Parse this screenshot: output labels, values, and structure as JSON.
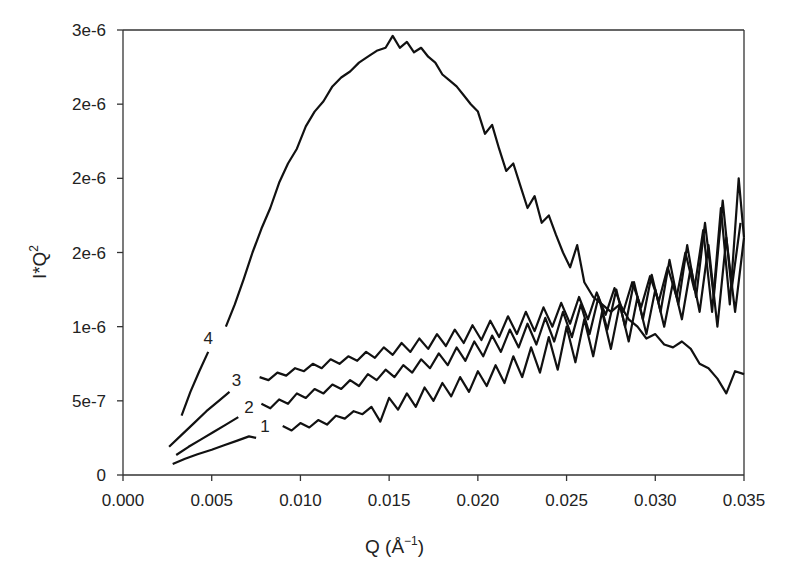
{
  "chart_data": {
    "type": "line",
    "title": "",
    "xlabel": "Q (Å",
    "xlabel_sup": "−1",
    "xlabel_close": ")",
    "ylabel": "I*Q",
    "ylabel_sup": "2",
    "xlim": [
      0.0,
      0.035
    ],
    "ylim": [
      0,
      3e-06
    ],
    "grid": false,
    "legend": "none (inline curve labels)",
    "x_ticks": [
      0.0,
      0.005,
      0.01,
      0.015,
      0.02,
      0.025,
      0.03,
      0.035
    ],
    "x_tick_labels": [
      "0.000",
      "0.005",
      "0.010",
      "0.015",
      "0.020",
      "0.025",
      "0.030",
      "0.035"
    ],
    "y_ticks": [
      0,
      5e-07,
      1e-06,
      1.5e-06,
      2e-06,
      2.5e-06,
      3e-06
    ],
    "y_tick_labels": [
      "0",
      "5e-7",
      "1e-6",
      "2e-6",
      "2e-6",
      "2e-6",
      "3e-6"
    ],
    "series": [
      {
        "name": "1",
        "label": "1",
        "label_at": [
          0.008,
          2.9e-07
        ],
        "segments": [
          {
            "x": [
              0.0028,
              0.0035,
              0.0042,
              0.005,
              0.0057,
              0.0064,
              0.0071,
              0.0075
            ],
            "y": [
              7.5e-08,
              1.1e-07,
              1.4e-07,
              1.7e-07,
              2e-07,
              2.3e-07,
              2.6e-07,
              2.5e-07
            ]
          },
          {
            "x": [
              0.009,
              0.0095,
              0.01,
              0.0105,
              0.011,
              0.0115,
              0.012,
              0.0125,
              0.013,
              0.0135,
              0.014,
              0.0145,
              0.015,
              0.0155,
              0.016,
              0.0165,
              0.017,
              0.0175,
              0.018,
              0.0185,
              0.019,
              0.0195,
              0.02,
              0.0205,
              0.021,
              0.0215,
              0.022,
              0.0225,
              0.023,
              0.0235,
              0.024,
              0.0245,
              0.025,
              0.0255,
              0.026,
              0.0265,
              0.027,
              0.0275,
              0.028,
              0.0285,
              0.029,
              0.0295,
              0.03,
              0.0305,
              0.031,
              0.0315,
              0.032,
              0.0325,
              0.033,
              0.0335,
              0.034,
              0.0345,
              0.035
            ],
            "y": [
              3.3e-07,
              3e-07,
              3.5e-07,
              3.2e-07,
              3.7e-07,
              3.4e-07,
              4e-07,
              3.8e-07,
              4.3e-07,
              4.1e-07,
              4.6e-07,
              3.6e-07,
              5.2e-07,
              4.4e-07,
              5.5e-07,
              4.6e-07,
              5.9e-07,
              5e-07,
              6.2e-07,
              5.3e-07,
              6.6e-07,
              5.6e-07,
              7e-07,
              6e-07,
              7.4e-07,
              6.2e-07,
              8e-07,
              6.6e-07,
              8.6e-07,
              6.9e-07,
              9.3e-07,
              7.1e-07,
              1e-06,
              7.6e-07,
              1.05e-06,
              8e-07,
              1.1e-06,
              8.5e-07,
              1.15e-06,
              9e-07,
              1.2e-06,
              9.5e-07,
              1.25e-06,
              1e-06,
              1.3e-06,
              1.05e-06,
              1.4e-06,
              1.1e-06,
              1.55e-06,
              1e-06,
              1.6e-06,
              1.1e-06,
              1.6e-06
            ]
          }
        ]
      },
      {
        "name": "2",
        "label": "2",
        "label_at": [
          0.0071,
          4.2e-07
        ],
        "segments": [
          {
            "x": [
              0.003,
              0.0037,
              0.0044,
              0.0051,
              0.0058,
              0.0065
            ],
            "y": [
              1.35e-07,
              1.9e-07,
              2.4e-07,
              2.9e-07,
              3.4e-07,
              3.9e-07
            ]
          },
          {
            "x": [
              0.0078,
              0.0083,
              0.0088,
              0.0093,
              0.0098,
              0.0103,
              0.0108,
              0.0113,
              0.0118,
              0.0123,
              0.0128,
              0.0133,
              0.0138,
              0.0143,
              0.0148,
              0.0153,
              0.0158,
              0.0163,
              0.0168,
              0.0173,
              0.0178,
              0.0183,
              0.0188,
              0.0193,
              0.0198,
              0.0203,
              0.0208,
              0.0213,
              0.0218,
              0.0223,
              0.0228,
              0.0233,
              0.0238,
              0.0243,
              0.0248,
              0.0253,
              0.0258,
              0.0263,
              0.0268,
              0.0273,
              0.0278,
              0.0283,
              0.0288,
              0.0293,
              0.0298,
              0.0303,
              0.0308,
              0.0313,
              0.0318,
              0.0323,
              0.0328,
              0.0333,
              0.0338,
              0.0343,
              0.0348
            ],
            "y": [
              4.8e-07,
              4.5e-07,
              5.1e-07,
              4.8e-07,
              5.5e-07,
              5.2e-07,
              5.8e-07,
              5.5e-07,
              6.1e-07,
              5.8e-07,
              6.4e-07,
              6e-07,
              6.8e-07,
              6.4e-07,
              7.1e-07,
              6.6e-07,
              7.4e-07,
              6.9e-07,
              7.8e-07,
              7.2e-07,
              8.2e-07,
              7.4e-07,
              8.6e-07,
              7.7e-07,
              9e-07,
              8e-07,
              9.4e-07,
              8.3e-07,
              9.8e-07,
              8.6e-07,
              1.02e-06,
              8.8e-07,
              1.06e-06,
              9e-07,
              1.1e-06,
              9.3e-07,
              1.15e-06,
              9.5e-07,
              1.2e-06,
              9.8e-07,
              1.25e-06,
              1e-06,
              1.3e-06,
              1.05e-06,
              1.35e-06,
              1.1e-06,
              1.45e-06,
              1.15e-06,
              1.55e-06,
              1.2e-06,
              1.7e-06,
              1.2e-06,
              1.85e-06,
              1.25e-06,
              1.7e-06
            ]
          }
        ]
      },
      {
        "name": "3",
        "label": "3",
        "label_at": [
          0.0064,
          6e-07
        ],
        "segments": [
          {
            "x": [
              0.0026,
              0.0033,
              0.004,
              0.0047,
              0.0054,
              0.006
            ],
            "y": [
              1.9e-07,
              2.7e-07,
              3.5e-07,
              4.3e-07,
              5e-07,
              5.6e-07
            ]
          },
          {
            "x": [
              0.0077,
              0.0082,
              0.0087,
              0.0092,
              0.0097,
              0.0102,
              0.0107,
              0.0112,
              0.0117,
              0.0122,
              0.0127,
              0.0132,
              0.0137,
              0.0142,
              0.0147,
              0.0152,
              0.0157,
              0.0162,
              0.0167,
              0.0172,
              0.0177,
              0.0182,
              0.0187,
              0.0192,
              0.0197,
              0.0202,
              0.0207,
              0.0212,
              0.0217,
              0.0222,
              0.0227,
              0.0232,
              0.0237,
              0.0242,
              0.0247,
              0.0252,
              0.0257,
              0.0262,
              0.0267,
              0.0272,
              0.0277,
              0.0282,
              0.0287,
              0.0292,
              0.0297,
              0.0302,
              0.0307,
              0.0312,
              0.0317,
              0.0322,
              0.0327,
              0.0332,
              0.0337,
              0.0342,
              0.0347,
              0.035
            ],
            "y": [
              6.6e-07,
              6.4e-07,
              6.9e-07,
              6.7e-07,
              7.2e-07,
              7e-07,
              7.5e-07,
              7.2e-07,
              7.8e-07,
              7.5e-07,
              8e-07,
              7.7e-07,
              8.3e-07,
              7.9e-07,
              8.6e-07,
              8.1e-07,
              8.9e-07,
              8.3e-07,
              9.2e-07,
              8.5e-07,
              9.5e-07,
              8.7e-07,
              9.8e-07,
              8.9e-07,
              1.01e-06,
              9.1e-07,
              1.04e-06,
              9.3e-07,
              1.07e-06,
              9.5e-07,
              1.1e-06,
              9.7e-07,
              1.13e-06,
              1e-06,
              1.16e-06,
              1.02e-06,
              1.2e-06,
              1.05e-06,
              1.23e-06,
              1.08e-06,
              1.26e-06,
              1.1e-06,
              1.3e-06,
              1.13e-06,
              1.34e-06,
              1.17e-06,
              1.4e-06,
              1.2e-06,
              1.5e-06,
              1.25e-06,
              1.65e-06,
              1.1e-06,
              1.8e-06,
              1.15e-06,
              2e-06,
              1.6e-06
            ]
          }
        ]
      },
      {
        "name": "4",
        "label": "4",
        "label_at": [
          0.0048,
          8.8e-07
        ],
        "segments": [
          {
            "x": [
              0.0033,
              0.0038,
              0.0043,
              0.0048
            ],
            "y": [
              4e-07,
              5.6e-07,
              7e-07,
              8.3e-07
            ]
          },
          {
            "x": [
              0.0058,
              0.0063,
              0.0068,
              0.0073,
              0.0078,
              0.0083,
              0.0088,
              0.0093,
              0.0098,
              0.0103,
              0.0108,
              0.0113,
              0.0118,
              0.0123,
              0.0128,
              0.0133,
              0.0138,
              0.0143,
              0.0148,
              0.0152,
              0.0156,
              0.016,
              0.0164,
              0.0168,
              0.0172,
              0.0176,
              0.018,
              0.0184,
              0.0188,
              0.0192,
              0.0196,
              0.02,
              0.0204,
              0.0208,
              0.0212,
              0.0216,
              0.022,
              0.0224,
              0.0228,
              0.0232,
              0.0236,
              0.024,
              0.0244,
              0.0248,
              0.0252,
              0.0256,
              0.026,
              0.0265,
              0.027,
              0.0275,
              0.028,
              0.0285,
              0.029,
              0.0295,
              0.03,
              0.0305,
              0.031,
              0.0315,
              0.032,
              0.0325,
              0.033,
              0.0335,
              0.034,
              0.0345,
              0.035
            ],
            "y": [
              1e-06,
              1.15e-06,
              1.32e-06,
              1.5e-06,
              1.66e-06,
              1.8e-06,
              1.97e-06,
              2.1e-06,
              2.2e-06,
              2.35e-06,
              2.45e-06,
              2.52e-06,
              2.62e-06,
              2.68e-06,
              2.72e-06,
              2.78e-06,
              2.82e-06,
              2.86e-06,
              2.88e-06,
              2.96e-06,
              2.88e-06,
              2.92e-06,
              2.85e-06,
              2.88e-06,
              2.82e-06,
              2.78e-06,
              2.7e-06,
              2.66e-06,
              2.62e-06,
              2.56e-06,
              2.5e-06,
              2.45e-06,
              2.3e-06,
              2.36e-06,
              2.2e-06,
              2.05e-06,
              2.1e-06,
              1.95e-06,
              1.8e-06,
              1.88e-06,
              1.7e-06,
              1.75e-06,
              1.62e-06,
              1.5e-06,
              1.4e-06,
              1.55e-06,
              1.3e-06,
              1.2e-06,
              1.15e-06,
              1.1e-06,
              1.15e-06,
              1.05e-06,
              1e-06,
              9.2e-07,
              9.5e-07,
              8.8e-07,
              8.6e-07,
              9e-07,
              8.5e-07,
              7.5e-07,
              7.2e-07,
              6.5e-07,
              5.5e-07,
              7e-07,
              6.8e-07
            ]
          }
        ]
      }
    ]
  }
}
